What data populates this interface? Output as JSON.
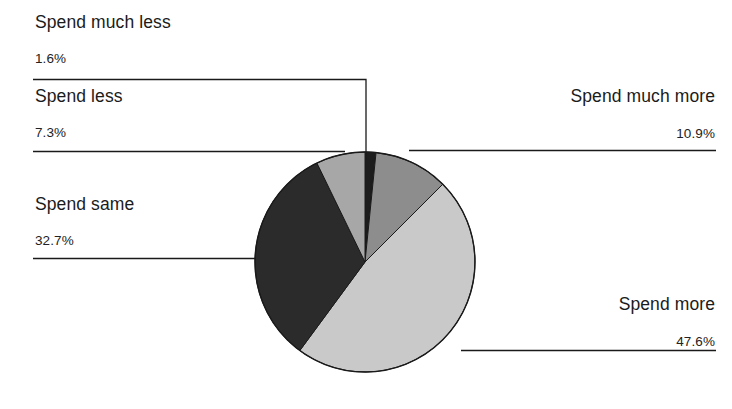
{
  "chart_data": {
    "type": "pie",
    "title": "",
    "subtitle": "",
    "xlabel": "",
    "ylabel": "",
    "legend_position": "callout-labels",
    "grid": false,
    "units": "percent",
    "total": 100.1,
    "categories": [
      "Spend much less",
      "Spend much more",
      "Spend more",
      "Spend same",
      "Spend less"
    ],
    "values": [
      1.6,
      10.9,
      47.6,
      32.7,
      7.3
    ],
    "slices": [
      {
        "label": "Spend much less",
        "value": 1.6,
        "value_text": "1.6%",
        "color": "#1c1c1c",
        "start_angle": 0,
        "end_angle": 5.76
      },
      {
        "label": "Spend much more",
        "value": 10.9,
        "value_text": "10.9%",
        "color": "#8d8d8d",
        "start_angle": 5.76,
        "end_angle": 44.999
      },
      {
        "label": "Spend more",
        "value": 47.6,
        "value_text": "47.6%",
        "color": "#c9c9c9",
        "start_angle": 44.999,
        "end_angle": 216.36
      },
      {
        "label": "Spend same",
        "value": 32.7,
        "value_text": "32.7%",
        "color": "#2b2b2b",
        "start_angle": 216.36,
        "end_angle": 334.08
      },
      {
        "label": "Spend less",
        "value": 7.3,
        "value_text": "7.3%",
        "color": "#a7a7a7",
        "start_angle": 334.08,
        "end_angle": 360
      }
    ]
  },
  "callouts": {
    "spend_much_less": {
      "label": "Spend much less",
      "value": "1.6%"
    },
    "spend_less": {
      "label": "Spend less",
      "value": "7.3%"
    },
    "spend_same": {
      "label": "Spend same",
      "value": "32.7%"
    },
    "spend_much_more": {
      "label": "Spend much more",
      "value": "10.9%"
    },
    "spend_more": {
      "label": "Spend more",
      "value": "47.6%"
    }
  },
  "style": {
    "background": "#ffffff",
    "leader_line_color": "#1a1a1a",
    "pie_outline_color": "#1a1a1a",
    "text_color": "#1b1b1b"
  }
}
